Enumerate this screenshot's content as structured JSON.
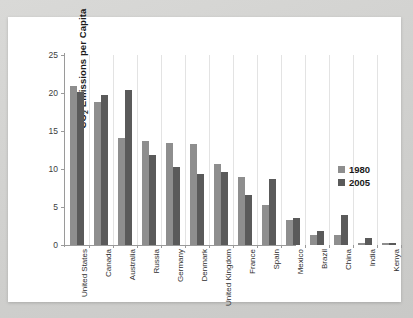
{
  "chart_data": {
    "type": "bar",
    "title": "",
    "xlabel": "",
    "ylabel": "CO2 Emissions per Capita",
    "ylabel_parts": {
      "prefix": "CO",
      "sub": "2",
      "suffix": " Emissions per Capita"
    },
    "ylim": [
      0,
      25
    ],
    "yticks": [
      0,
      5,
      10,
      15,
      20,
      25
    ],
    "grid": "vertical-only",
    "legend_position": "right",
    "categories": [
      "United States",
      "Canada",
      "Australia",
      "Russia",
      "Germany",
      "Denmark",
      "United Kingdom",
      "France",
      "Spain",
      "Mexico",
      "Brazil",
      "China",
      "India",
      "Kenya"
    ],
    "series": [
      {
        "name": "1980",
        "color": "#8e8e8e",
        "values": [
          20.9,
          18.8,
          14.1,
          13.7,
          13.4,
          13.3,
          10.7,
          9.0,
          5.3,
          3.3,
          1.3,
          1.3,
          0.3,
          0.2
        ]
      },
      {
        "name": "2005",
        "color": "#5a5a5a",
        "values": [
          20.1,
          19.7,
          20.4,
          11.8,
          10.2,
          9.3,
          9.6,
          6.6,
          8.7,
          3.6,
          1.8,
          3.9,
          0.9,
          0.2
        ]
      }
    ]
  },
  "legend": {
    "items": [
      {
        "label": "1980",
        "color": "#8e8e8e"
      },
      {
        "label": "2005",
        "color": "#5a5a5a"
      }
    ]
  },
  "colors": {
    "series_1980": "#8e8e8e",
    "series_2005": "#5a5a5a",
    "axis": "#9a9a9a",
    "gridline": "#e3e3e3",
    "card_background": "#ffffff",
    "page_background": "#d4d4d2"
  }
}
